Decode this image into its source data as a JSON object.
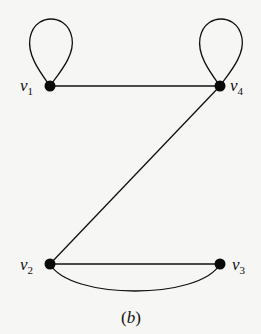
{
  "figure": {
    "caption_open": "(",
    "caption_letter": "b",
    "caption_close": ")",
    "stroke_color": "#111111",
    "node_color": "#0a0a0a",
    "background": "#f6f6f4"
  },
  "vertices": [
    {
      "id": "v1",
      "label": "v",
      "sub": "1",
      "x": 50,
      "y": 86
    },
    {
      "id": "v4",
      "label": "v",
      "sub": "4",
      "x": 220,
      "y": 86
    },
    {
      "id": "v2",
      "label": "v",
      "sub": "2",
      "x": 50,
      "y": 264
    },
    {
      "id": "v3",
      "label": "v",
      "sub": "3",
      "x": 220,
      "y": 264
    }
  ],
  "edges": [
    {
      "from": "v1",
      "to": "v1",
      "type": "loop"
    },
    {
      "from": "v4",
      "to": "v4",
      "type": "loop"
    },
    {
      "from": "v1",
      "to": "v4",
      "type": "straight"
    },
    {
      "from": "v4",
      "to": "v2",
      "type": "straight"
    },
    {
      "from": "v2",
      "to": "v3",
      "type": "straight"
    },
    {
      "from": "v2",
      "to": "v3",
      "type": "curved"
    }
  ]
}
